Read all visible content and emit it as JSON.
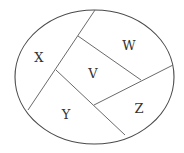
{
  "diagram": {
    "type": "partitioned-ellipse",
    "regions": [
      {
        "label": "X",
        "x": 39,
        "y": 57
      },
      {
        "label": "W",
        "x": 129,
        "y": 45
      },
      {
        "label": "V",
        "x": 93,
        "y": 73
      },
      {
        "label": "Y",
        "x": 66,
        "y": 114
      },
      {
        "label": "Z",
        "x": 139,
        "y": 108
      }
    ],
    "colors": {
      "outline": "#4a4a4a",
      "divider": "#6a6a6a",
      "label": "#333333",
      "background": "#ffffff"
    }
  }
}
